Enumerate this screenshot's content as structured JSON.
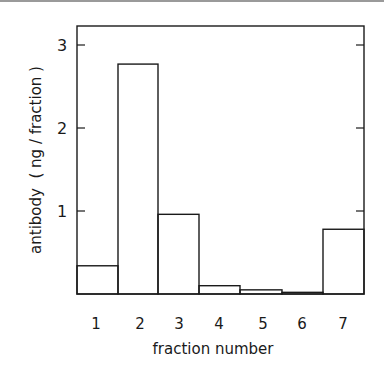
{
  "chart_data": {
    "type": "bar",
    "title": "",
    "xlabel": "fraction number",
    "ylabel": "antibody  ( ng / fraction )",
    "categories": [
      "1",
      "2",
      "3",
      "4",
      "5",
      "6",
      "7"
    ],
    "values": [
      0.34,
      2.77,
      0.96,
      0.1,
      0.05,
      0.02,
      0.78
    ],
    "ylim": [
      0,
      3.2
    ],
    "yticks": [
      "1",
      "2",
      "3"
    ],
    "grid": false,
    "legend": null,
    "style": "histogram, unfilled bars, contiguous"
  },
  "colors": {
    "line": "#1a1a1a",
    "background": "#ffffff"
  }
}
